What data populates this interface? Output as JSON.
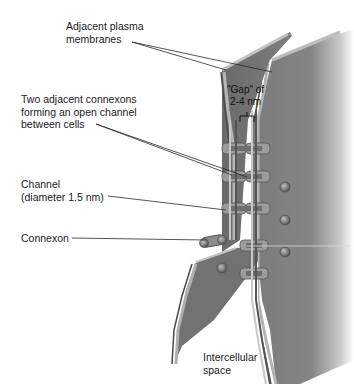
{
  "diagram": {
    "labels": {
      "membranes": "Adjacent plasma\nmembranes",
      "connexons_pair": "Two adjacent connexons\nforming an open channel\nbetween cells",
      "channel": "Channel\n(diameter 1.5 nm)",
      "connexon": "Connexon",
      "gap": "\"Gap\" of\n2-4 nm",
      "intercellular": "Intercellular\nspace"
    },
    "colors": {
      "membrane_face": "#7a7a7a",
      "membrane_edge_light": "#b8b8b8",
      "membrane_edge_dark": "#4a4a4a",
      "connexon": "#9a9a9a",
      "leader_line": "#333333",
      "background": "#ffffff"
    },
    "connexon_count_paired": 5,
    "connexon_count_single": 6
  }
}
